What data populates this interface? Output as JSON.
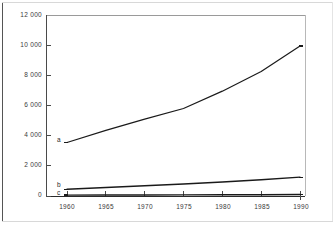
{
  "chart_data": {
    "type": "line",
    "title": "",
    "subtitle": "",
    "xlabel": "",
    "ylabel": "",
    "x": [
      1960,
      1965,
      1970,
      1975,
      1980,
      1985,
      1990
    ],
    "xtick_labels": [
      "1960",
      "1965",
      "1970",
      "1975",
      "1980",
      "1985",
      "1990"
    ],
    "ytick_labels": [
      "12 000",
      "10 000",
      "8 000",
      "6 000",
      "4 000",
      "2 000",
      "0"
    ],
    "ytick_values": [
      12000,
      10000,
      8000,
      6000,
      4000,
      2000,
      0
    ],
    "xlim": [
      1960,
      1990
    ],
    "ylim": [
      0,
      12000
    ],
    "grid": false,
    "legend_position": "inline-left",
    "series": [
      {
        "name": "a",
        "label": "a",
        "color": "#1a1a1a",
        "values": [
          3550,
          4350,
          5100,
          5800,
          6950,
          8250,
          9950
        ]
      },
      {
        "name": "b",
        "label": "b",
        "color": "#1a1a1a",
        "values": [
          450,
          560,
          680,
          800,
          930,
          1080,
          1250
        ]
      },
      {
        "name": "c",
        "label": "c",
        "color": "#1a1a1a",
        "values": [
          60,
          65,
          70,
          75,
          80,
          85,
          95
        ]
      }
    ]
  },
  "axes": {
    "y_axis_color": "#4a4a4a",
    "x_axis_color": "#2a2a2a",
    "tick_color": "#4a4a4a"
  },
  "yticks": [
    {
      "label": "12 000"
    },
    {
      "label": "10 000"
    },
    {
      "label": "8 000"
    },
    {
      "label": "6 000"
    },
    {
      "label": "4 000"
    },
    {
      "label": "2 000"
    },
    {
      "label": "0"
    }
  ],
  "xticks": [
    {
      "label": "1960"
    },
    {
      "label": "1965"
    },
    {
      "label": "1970"
    },
    {
      "label": "1975"
    },
    {
      "label": "1980"
    },
    {
      "label": "1985"
    },
    {
      "label": "1990"
    }
  ],
  "series_labels": [
    {
      "label": "a"
    },
    {
      "label": "b"
    },
    {
      "label": "c"
    }
  ]
}
